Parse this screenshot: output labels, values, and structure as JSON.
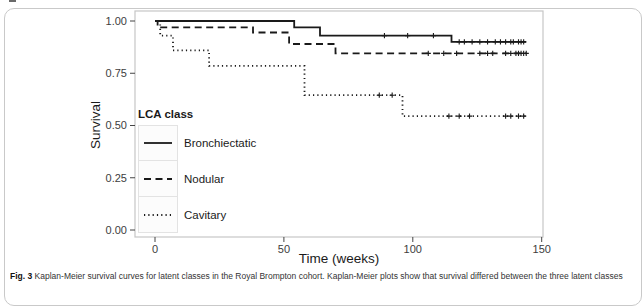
{
  "figure": {
    "caption_label": "Fig. 3",
    "caption_text": "Kaplan-Meier survival curves for latent classes in the Royal Brompton cohort. Kaplan-Meier plots show that survival differed between the three latent classes"
  },
  "chart_data": {
    "type": "line",
    "subtype": "kaplan-meier-step",
    "title": "",
    "xlabel": "Time (weeks)",
    "ylabel": "Survival",
    "xlim": [
      0,
      150
    ],
    "ylim": [
      0.0,
      1.0
    ],
    "grid": false,
    "line_color": "#1a1a1a",
    "x_ticks": [
      {
        "value": 0,
        "label": "0"
      },
      {
        "value": 50,
        "label": "50"
      },
      {
        "value": 100,
        "label": "100"
      },
      {
        "value": 150,
        "label": "150"
      }
    ],
    "y_ticks": [
      {
        "value": 0.0,
        "label": "0.00"
      },
      {
        "value": 0.25,
        "label": "0.25"
      },
      {
        "value": 0.5,
        "label": "0.50"
      },
      {
        "value": 0.75,
        "label": "0.75"
      },
      {
        "value": 1.0,
        "label": "1.00"
      }
    ],
    "legend": {
      "title": "LCA class",
      "position": "inside-left"
    },
    "series": [
      {
        "name": "Bronchiectatic",
        "line_style": "solid",
        "steps": [
          [
            0,
            1.0
          ],
          [
            54,
            1.0
          ],
          [
            54,
            0.97
          ],
          [
            64,
            0.97
          ],
          [
            64,
            0.93
          ],
          [
            115,
            0.93
          ],
          [
            115,
            0.9
          ],
          [
            144,
            0.9
          ]
        ],
        "censor_marks": [
          [
            89,
            0.93
          ],
          [
            98,
            0.93
          ],
          [
            108,
            0.93
          ],
          [
            118,
            0.9
          ],
          [
            120,
            0.9
          ],
          [
            123,
            0.9
          ],
          [
            126,
            0.9
          ],
          [
            129,
            0.9
          ],
          [
            132,
            0.9
          ],
          [
            134,
            0.9
          ],
          [
            136,
            0.9
          ],
          [
            138,
            0.9
          ],
          [
            139,
            0.9
          ],
          [
            141,
            0.9
          ],
          [
            142,
            0.9
          ],
          [
            143,
            0.9
          ]
        ]
      },
      {
        "name": "Nodular",
        "line_style": "dashed",
        "steps": [
          [
            0,
            1.0
          ],
          [
            1,
            1.0
          ],
          [
            1,
            0.97
          ],
          [
            38,
            0.97
          ],
          [
            38,
            0.945
          ],
          [
            52,
            0.945
          ],
          [
            52,
            0.89
          ],
          [
            70,
            0.89
          ],
          [
            70,
            0.845
          ],
          [
            144,
            0.845
          ]
        ],
        "censor_marks": [
          [
            106,
            0.845
          ],
          [
            112,
            0.845
          ],
          [
            117,
            0.845
          ],
          [
            126,
            0.845
          ],
          [
            129,
            0.845
          ],
          [
            131,
            0.845
          ],
          [
            136,
            0.845
          ],
          [
            138,
            0.845
          ],
          [
            140,
            0.845
          ],
          [
            141,
            0.845
          ],
          [
            142,
            0.845
          ],
          [
            143,
            0.845
          ],
          [
            144,
            0.845
          ]
        ]
      },
      {
        "name": "Cavitary",
        "line_style": "dotted",
        "steps": [
          [
            0,
            1.0
          ],
          [
            2,
            1.0
          ],
          [
            2,
            0.93
          ],
          [
            7,
            0.93
          ],
          [
            7,
            0.86
          ],
          [
            21,
            0.86
          ],
          [
            21,
            0.785
          ],
          [
            58,
            0.785
          ],
          [
            58,
            0.645
          ],
          [
            96,
            0.645
          ],
          [
            96,
            0.545
          ],
          [
            144,
            0.545
          ]
        ],
        "censor_marks": [
          [
            87,
            0.645
          ],
          [
            92,
            0.645
          ],
          [
            114,
            0.545
          ],
          [
            118,
            0.545
          ],
          [
            122,
            0.545
          ],
          [
            136,
            0.545
          ],
          [
            138,
            0.545
          ],
          [
            141,
            0.545
          ],
          [
            143,
            0.545
          ]
        ]
      }
    ]
  }
}
